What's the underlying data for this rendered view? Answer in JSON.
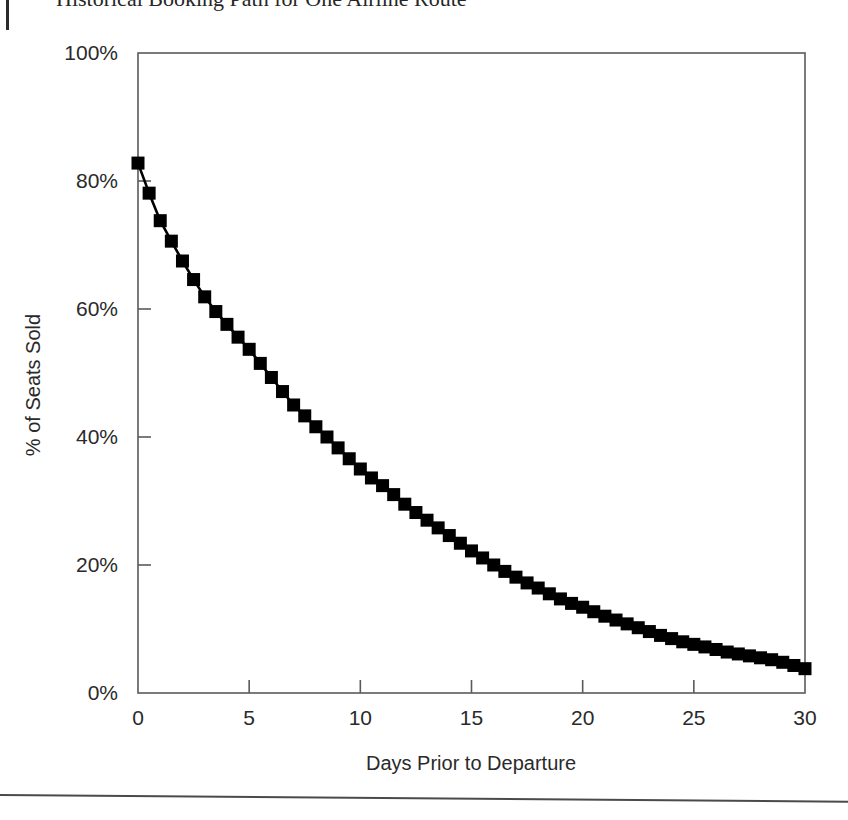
{
  "page": {
    "figure_title": "Historical Booking Path for One Airline Route"
  },
  "chart_data": {
    "type": "line",
    "title": "Historical Booking Path for One Airline Route",
    "xlabel": "Days Prior to Departure",
    "ylabel": "% of Seats Sold",
    "xlim": [
      0,
      30
    ],
    "ylim": [
      0,
      100
    ],
    "grid": false,
    "legend": null,
    "marker": "square",
    "marker_color": "#000000",
    "line_color": "#000000",
    "xticks": [
      0,
      5,
      10,
      15,
      20,
      25,
      30
    ],
    "xtick_labels": [
      "0",
      "5",
      "10",
      "15",
      "20",
      "25",
      "30"
    ],
    "yticks": [
      0,
      20,
      40,
      60,
      80,
      100
    ],
    "ytick_labels": [
      "0%",
      "20%",
      "40%",
      "60%",
      "80%",
      "100%"
    ],
    "x": [
      0,
      0.5,
      1,
      1.5,
      2,
      2.5,
      3,
      3.5,
      4,
      4.5,
      5,
      5.5,
      6,
      6.5,
      7,
      7.5,
      8,
      8.5,
      9,
      9.5,
      10,
      10.5,
      11,
      11.5,
      12,
      12.5,
      13,
      13.5,
      14,
      14.5,
      15,
      15.5,
      16,
      16.5,
      17,
      17.5,
      18,
      18.5,
      19,
      19.5,
      20,
      20.5,
      21,
      21.5,
      22,
      22.5,
      23,
      23.5,
      24,
      24.5,
      25,
      25.5,
      26,
      26.5,
      27,
      27.5,
      28,
      28.5,
      29,
      29.5,
      30
    ],
    "y": [
      82.8,
      78.1,
      73.8,
      70.6,
      67.5,
      64.6,
      61.9,
      59.6,
      57.6,
      55.6,
      53.7,
      51.5,
      49.3,
      47.1,
      45.0,
      43.3,
      41.6,
      40.0,
      38.3,
      36.6,
      35.0,
      33.6,
      32.4,
      31.0,
      29.5,
      28.2,
      27.0,
      25.8,
      24.6,
      23.4,
      22.2,
      21.1,
      20.0,
      19.0,
      18.1,
      17.2,
      16.4,
      15.5,
      14.7,
      14.0,
      13.4,
      12.7,
      12.0,
      11.4,
      10.8,
      10.2,
      9.6,
      9.0,
      8.5,
      8.0,
      7.6,
      7.2,
      6.8,
      6.4,
      6.1,
      5.8,
      5.5,
      5.2,
      4.8,
      4.3,
      3.8
    ],
    "series": [
      {
        "name": "Cumulative bookings",
        "values": [
          82.8,
          78.1,
          73.8,
          70.6,
          67.5,
          64.6,
          61.9,
          59.6,
          57.6,
          55.6,
          53.7,
          51.5,
          49.3,
          47.1,
          45.0,
          43.3,
          41.6,
          40.0,
          38.3,
          36.6,
          35.0,
          33.6,
          32.4,
          31.0,
          29.5,
          28.2,
          27.0,
          25.8,
          24.6,
          23.4,
          22.2,
          21.1,
          20.0,
          19.0,
          18.1,
          17.2,
          16.4,
          15.5,
          14.7,
          14.0,
          13.4,
          12.7,
          12.0,
          11.4,
          10.8,
          10.2,
          9.6,
          9.0,
          8.5,
          8.0,
          7.6,
          7.2,
          6.8,
          6.4,
          6.1,
          5.8,
          5.5,
          5.2,
          4.8,
          4.3,
          3.8
        ]
      }
    ]
  }
}
